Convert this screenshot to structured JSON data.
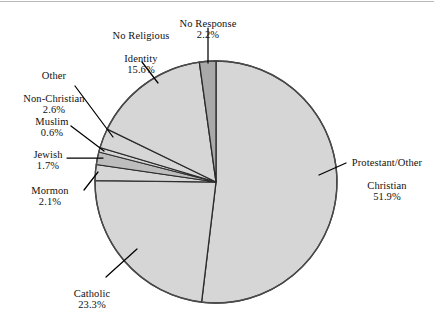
{
  "figure": {
    "type": "pie-chart",
    "background_color": "#ffffff",
    "top_rule_color": "#b9b9b9"
  },
  "chart_data": {
    "type": "pie",
    "title": "",
    "subtitle": "",
    "xlabel": "",
    "ylabel": "",
    "grid": false,
    "legend_position": "none",
    "label_style": "external labels with leader lines",
    "units": "percent",
    "start_angle_deg": 0,
    "direction": "clockwise",
    "categories": [
      "Protestant/Other Christian",
      "Catholic",
      "Mormon",
      "Jewish",
      "Muslim",
      "Other Non-Christian",
      "No Religious Identity",
      "No Response"
    ],
    "values": [
      51.9,
      23.3,
      2.1,
      1.7,
      0.6,
      2.6,
      15.6,
      2.2
    ],
    "slices": [
      {
        "label": "Protestant/Other Christian",
        "label_line1": "Protestant/Other",
        "label_line2": "Christian",
        "value": 51.9,
        "percent_text": "51.9%",
        "color": "#d6d6d6"
      },
      {
        "label": "Catholic",
        "label_line1": "Catholic",
        "label_line2": "",
        "value": 23.3,
        "percent_text": "23.3%",
        "color": "#d6d6d6"
      },
      {
        "label": "Mormon",
        "label_line1": "Mormon",
        "label_line2": "",
        "value": 2.1,
        "percent_text": "2.1%",
        "color": "#d6d6d6"
      },
      {
        "label": "Jewish",
        "label_line1": "Jewish",
        "label_line2": "",
        "value": 1.7,
        "percent_text": "1.7%",
        "color": "#bdbdbd"
      },
      {
        "label": "Muslim",
        "label_line1": "Muslim",
        "label_line2": "",
        "value": 0.6,
        "percent_text": "0.6%",
        "color": "#d6d6d6"
      },
      {
        "label": "Other Non-Christian",
        "label_line1": "Other",
        "label_line2": "Non-Christian",
        "value": 2.6,
        "percent_text": "2.6%",
        "color": "#d6d6d6"
      },
      {
        "label": "No Religious Identity",
        "label_line1": "No Religious",
        "label_line2": "Identity",
        "value": 15.6,
        "percent_text": "15.6%",
        "color": "#d6d6d6"
      },
      {
        "label": "No Response",
        "label_line1": "No Response",
        "label_line2": "",
        "value": 2.2,
        "percent_text": "2.2%",
        "color": "#a9a9a9"
      }
    ]
  },
  "labels": {
    "no_religious_identity": {
      "line1": "No Religious",
      "line2": "Identity",
      "pct": "15.6%"
    },
    "no_response": {
      "line1": "No Response",
      "line2": "",
      "pct": "2.2%"
    },
    "other_non_christian": {
      "line1": "Other",
      "line2": "Non-Christian",
      "pct": "2.6%"
    },
    "muslim": {
      "line1": "Muslim",
      "line2": "",
      "pct": "0.6%"
    },
    "jewish": {
      "line1": "Jewish",
      "line2": "",
      "pct": "1.7%"
    },
    "mormon": {
      "line1": "Mormon",
      "line2": "",
      "pct": "2.1%"
    },
    "catholic": {
      "line1": "Catholic",
      "line2": "",
      "pct": "23.3%"
    },
    "protestant": {
      "line1": "Protestant/Other",
      "line2": "Christian",
      "pct": "51.9%"
    }
  }
}
